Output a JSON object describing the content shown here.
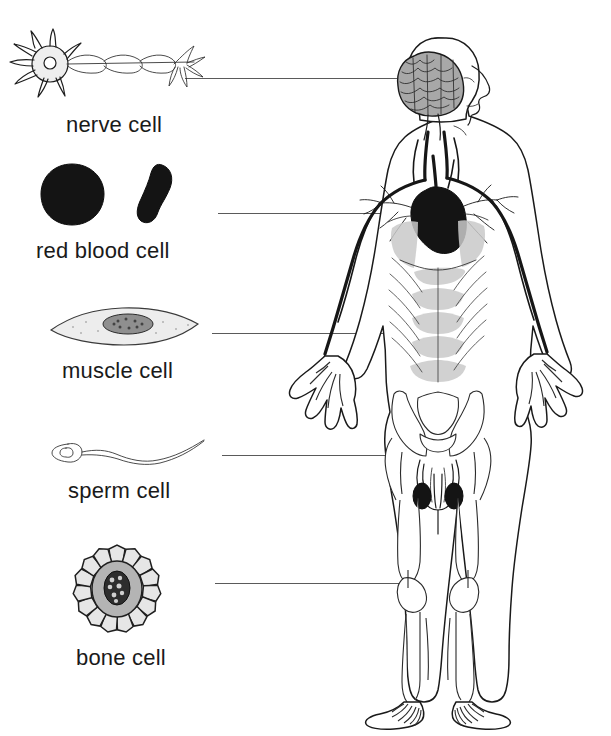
{
  "diagram": {
    "background_color": "#ffffff",
    "ink_color": "#1a1a1a",
    "leader_line_color": "#5a5a5a"
  },
  "cells": [
    {
      "id": "nerve-cell",
      "label": "nerve cell",
      "icon": "neuron-icon",
      "description": "star-shaped soma with dendrites and a myelinated axon",
      "label_x": 66,
      "label_y": 112,
      "leader": {
        "x": 185,
        "y": 78,
        "width": 212
      },
      "target": "brain"
    },
    {
      "id": "red-blood-cell",
      "label": "red blood cell",
      "icon": "erythrocyte-icon",
      "description": "dark biconcave disc shown face-on and edge-on",
      "label_x": 36,
      "label_y": 238,
      "leader": {
        "x": 218,
        "y": 213,
        "width": 185
      },
      "target": "heart"
    },
    {
      "id": "muscle-cell",
      "label": "muscle cell",
      "icon": "myocyte-icon",
      "description": "spindle-shaped cell with a single dark central nucleus",
      "label_x": 62,
      "label_y": 358,
      "leader": {
        "x": 212,
        "y": 333,
        "width": 190
      },
      "target": "abdominal-muscles"
    },
    {
      "id": "sperm-cell",
      "label": "sperm cell",
      "icon": "spermatozoon-icon",
      "description": "oval head with a long whip-like flagellum",
      "label_x": 68,
      "label_y": 478,
      "leader": {
        "x": 222,
        "y": 455,
        "width": 188
      },
      "target": "reproductive-organs"
    },
    {
      "id": "bone-cell",
      "label": "bone cell",
      "icon": "osteocyte-icon",
      "description": "rounded cell in a lacuna with radiating canaliculi processes",
      "label_x": 76,
      "label_y": 645,
      "leader": {
        "x": 215,
        "y": 583,
        "width": 190
      },
      "target": "leg-bones"
    }
  ],
  "body_figure": {
    "name": "human-body-anatomy-figure",
    "view": "anterior full body",
    "systems_shown": [
      "nervous",
      "circulatory",
      "muscular",
      "reproductive",
      "skeletal"
    ],
    "parts": [
      {
        "name": "brain",
        "shading": "gray gyri"
      },
      {
        "name": "heart",
        "shading": "solid dark"
      },
      {
        "name": "blood-vessels",
        "shading": "dark lines"
      },
      {
        "name": "abdominal-muscles",
        "shading": "light gray"
      },
      {
        "name": "pelvis",
        "shading": "outline"
      },
      {
        "name": "reproductive-organs",
        "shading": "dark outline"
      },
      {
        "name": "leg-bones",
        "shading": "outline"
      },
      {
        "name": "foot-bones",
        "shading": "outline"
      }
    ]
  }
}
